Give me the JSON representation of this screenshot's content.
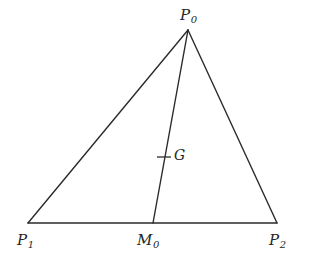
{
  "figure": {
    "name": "triangle-with-median-and-centroid",
    "background_color": "#ffffff",
    "line_color": "#2b2b2b",
    "label_color": "#262626",
    "stroke_width": 1.4,
    "points": {
      "P0": {
        "label": "P",
        "subscript": "0",
        "x": 188,
        "y": 30
      },
      "P1": {
        "label": "P",
        "subscript": "1",
        "x": 28,
        "y": 223
      },
      "P2": {
        "label": "P",
        "subscript": "2",
        "x": 277,
        "y": 223
      },
      "M0": {
        "label": "M",
        "subscript": "0",
        "x": 153,
        "y": 223
      },
      "G": {
        "label": "G",
        "subscript": "",
        "x": 164,
        "y": 157
      }
    },
    "segments": [
      {
        "name": "side-p0-p1",
        "from": "P0",
        "to": "P1"
      },
      {
        "name": "side-p0-p2",
        "from": "P0",
        "to": "P2"
      },
      {
        "name": "side-p1-p2",
        "from": "P1",
        "to": "P2"
      },
      {
        "name": "median-p0-m0",
        "from": "P0",
        "to": "M0"
      }
    ],
    "centroid_tick": {
      "name": "centroid-tick-mark",
      "x1": 157,
      "y1": 157,
      "x2": 171,
      "y2": 157
    }
  },
  "labels": {
    "p0_text": "P",
    "p0_sub": "0",
    "p1_text": "P",
    "p1_sub": "1",
    "p2_text": "P",
    "p2_sub": "2",
    "m0_text": "M",
    "m0_sub": "0",
    "g_text": "G"
  }
}
